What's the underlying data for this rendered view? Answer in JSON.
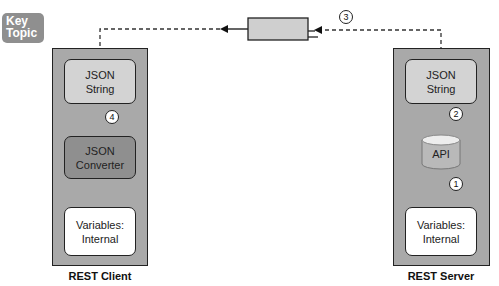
{
  "badge": {
    "line1": "Key",
    "line2": "Topic"
  },
  "client": {
    "label": "REST Client",
    "boxes": [
      {
        "line1": "JSON",
        "line2": "String"
      },
      {
        "line1": "JSON",
        "line2": "Converter"
      },
      {
        "line1": "Variables:",
        "line2": "Internal"
      }
    ],
    "step": "4"
  },
  "server": {
    "label": "REST Server",
    "boxes": [
      {
        "line1": "JSON",
        "line2": "String"
      },
      {
        "line1": "API"
      },
      {
        "line1": "Variables:",
        "line2": "Internal"
      }
    ],
    "steps": [
      "2",
      "1"
    ]
  },
  "transport": {
    "step": "3"
  },
  "colors": {
    "container": "#a9a9a9",
    "json_string": "#d3d3d3",
    "converter": "#8f8f8f",
    "variables": "#ffffff",
    "badge": "#8f8f8f"
  }
}
